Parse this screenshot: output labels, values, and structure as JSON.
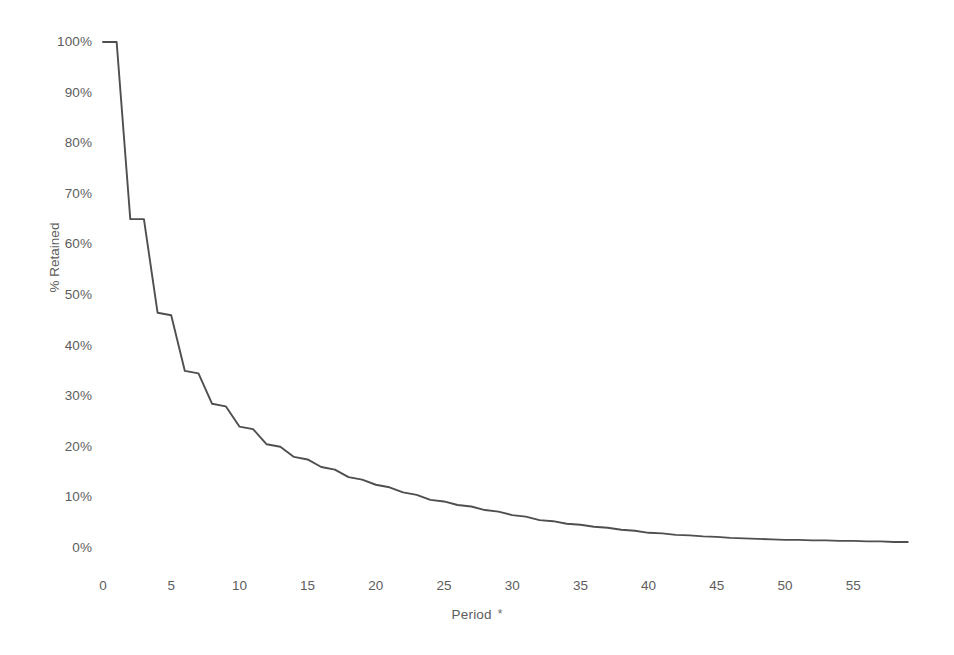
{
  "chart_data": {
    "type": "line",
    "title": "",
    "subtitle": "",
    "xlabel": "Period",
    "xlabel_footnote": "*",
    "ylabel": "% Retained",
    "xlim": [
      0,
      59
    ],
    "ylim": [
      0,
      100
    ],
    "grid": false,
    "legend": false,
    "legend_position": "none",
    "y_tick_labels": [
      "100%",
      "90%",
      "80%",
      "70%",
      "60%",
      "50%",
      "40%",
      "30%",
      "20%",
      "10%",
      "0%"
    ],
    "y_tick_values": [
      100,
      90,
      80,
      70,
      60,
      50,
      40,
      30,
      20,
      10,
      0
    ],
    "x_tick_labels": [
      "0",
      "5",
      "10",
      "15",
      "20",
      "25",
      "30",
      "35",
      "40",
      "45",
      "50",
      "55"
    ],
    "x_tick_values": [
      0,
      5,
      10,
      15,
      20,
      25,
      30,
      35,
      40,
      45,
      50,
      55
    ],
    "series": [
      {
        "name": "% Retained",
        "color": "#4f4f4f",
        "x": [
          0,
          1,
          2,
          3,
          4,
          5,
          6,
          7,
          8,
          9,
          10,
          11,
          12,
          13,
          14,
          15,
          16,
          17,
          18,
          19,
          20,
          21,
          22,
          23,
          24,
          25,
          26,
          27,
          28,
          29,
          30,
          31,
          32,
          33,
          34,
          35,
          36,
          37,
          38,
          39,
          40,
          41,
          42,
          43,
          44,
          45,
          46,
          47,
          48,
          49,
          50,
          51,
          52,
          53,
          54,
          55,
          56,
          57,
          58,
          59
        ],
        "values": [
          100,
          100,
          65,
          65,
          46.5,
          46,
          35,
          34.5,
          28.5,
          28,
          24,
          23.5,
          20.5,
          20,
          18,
          17.5,
          16,
          15.5,
          14,
          13.5,
          12.5,
          12,
          11,
          10.5,
          9.5,
          9.2,
          8.5,
          8.2,
          7.5,
          7.2,
          6.5,
          6.2,
          5.5,
          5.3,
          4.8,
          4.6,
          4.2,
          4,
          3.6,
          3.4,
          3,
          2.9,
          2.6,
          2.5,
          2.3,
          2.2,
          2,
          1.9,
          1.8,
          1.7,
          1.6,
          1.6,
          1.5,
          1.5,
          1.4,
          1.4,
          1.3,
          1.3,
          1.2,
          1.2
        ]
      }
    ],
    "annotations": []
  },
  "axes": {
    "y_title": "% Retained",
    "x_title": "Period",
    "x_title_mark": "*"
  },
  "style": {
    "line_color": "#4f4f4f",
    "text_color": "#5d5d5d",
    "background": "#ffffff"
  }
}
